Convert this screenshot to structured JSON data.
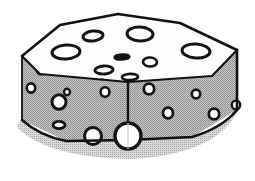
{
  "artwork": {
    "title": "Swiss Cheese Block",
    "subject": "block-of-swiss-cheese",
    "style": "black-and-white-clipart-line-art",
    "projection": "axonometric",
    "caption": "",
    "canvas": {
      "width": 255,
      "height": 181,
      "background": "#ffffff"
    }
  },
  "palette": {
    "outline": "#111111",
    "top_face_fill": "#fdfdfd",
    "left_face_fill": "#b2b2b2",
    "right_face_fill": "#b2b2b2",
    "hole_fill": "#ffffff",
    "hole_stroke": "#141414",
    "shadow_fill": "#bdbdbd",
    "paper_white": "#ffffff"
  },
  "geometry": {
    "top_face": {
      "name": "top-face",
      "points": "22,56 60,25 118,14 180,23 237,50 212,76 128,82 40,74"
    },
    "left_face": {
      "name": "left-face",
      "points": "22,56 40,74 128,82 128,140 66,141 22,120"
    },
    "right_face": {
      "name": "right-face",
      "points": "128,82 212,76 237,50 237,110 192,137 128,140"
    },
    "shadow": {
      "name": "drop-shadow",
      "points": "22,120 18,128 34,140 64,152 128,158 196,148 236,124 237,110 192,137 128,140 66,141"
    },
    "edges": [
      {
        "name": "edge-top-back-left",
        "d": "M22,56 L60,25 L118,14"
      },
      {
        "name": "edge-top-back-right",
        "d": "M118,14 L180,23 L237,50"
      },
      {
        "name": "edge-top-front-left",
        "d": "M22,56 L40,74 L128,82"
      },
      {
        "name": "edge-top-front-right",
        "d": "M128,82 L212,76 L237,50"
      },
      {
        "name": "edge-vertical-left",
        "d": "M22,56 L22,120"
      },
      {
        "name": "edge-vertical-front",
        "d": "M128,82 L128,140"
      },
      {
        "name": "edge-vertical-right",
        "d": "M237,50 L237,110"
      },
      {
        "name": "edge-bottom-left",
        "d": "M22,120 Q40,136 66,141 L128,140"
      },
      {
        "name": "edge-bottom-right",
        "d": "M128,140 L192,137 Q222,128 237,110"
      }
    ]
  },
  "holes": {
    "top_face": [
      {
        "name": "hole-top-1",
        "cx": 93,
        "cy": 36,
        "rx": 10,
        "ry": 5,
        "rot": -6,
        "stroke": 3.0
      },
      {
        "name": "hole-top-2",
        "cx": 140,
        "cy": 34,
        "rx": 13,
        "ry": 7,
        "rot": 3,
        "stroke": 3.0
      },
      {
        "name": "hole-top-3",
        "cx": 66,
        "cy": 52,
        "rx": 14,
        "ry": 7,
        "rot": -4,
        "stroke": 3.0
      },
      {
        "name": "hole-top-4",
        "cx": 196,
        "cy": 51,
        "rx": 14,
        "ry": 7,
        "rot": 4,
        "stroke": 3.0
      },
      {
        "name": "hole-top-5",
        "cx": 122,
        "cy": 57,
        "rx": 7,
        "ry": 2.2,
        "rot": -3,
        "stroke": 3.2
      },
      {
        "name": "hole-top-6",
        "cx": 150,
        "cy": 62,
        "rx": 7,
        "ry": 4.5,
        "rot": 2,
        "stroke": 2.6
      },
      {
        "name": "hole-top-7",
        "cx": 104,
        "cy": 70,
        "rx": 9,
        "ry": 4,
        "rot": -3,
        "stroke": 2.8
      },
      {
        "name": "hole-top-8",
        "cx": 130,
        "cy": 77,
        "rx": 8,
        "ry": 3.2,
        "rot": -2,
        "stroke": 2.8
      },
      {
        "name": "hole-top-9",
        "cx": 102,
        "cy": 80,
        "rx": 1.6,
        "ry": 1.1,
        "rot": 0,
        "stroke": 1.2
      }
    ],
    "left_face": [
      {
        "name": "hole-left-1",
        "cx": 41,
        "cy": 70,
        "rx": 4.2,
        "ry": 4.2,
        "rot": 0,
        "stroke": 2.6
      },
      {
        "name": "hole-left-2",
        "cx": 31,
        "cy": 88,
        "rx": 4.2,
        "ry": 4.6,
        "rot": 0,
        "stroke": 2.6
      },
      {
        "name": "hole-left-3",
        "cx": 67,
        "cy": 92,
        "rx": 3.0,
        "ry": 3.2,
        "rot": 0,
        "stroke": 2.4
      },
      {
        "name": "hole-left-4",
        "cx": 59,
        "cy": 102,
        "rx": 7.0,
        "ry": 7.2,
        "rot": 0,
        "stroke": 3.0
      },
      {
        "name": "hole-left-5",
        "cx": 105,
        "cy": 92,
        "rx": 4.5,
        "ry": 4.8,
        "rot": 0,
        "stroke": 2.6
      },
      {
        "name": "hole-left-6",
        "cx": 59,
        "cy": 125,
        "rx": 6.0,
        "ry": 3.6,
        "rot": 0,
        "stroke": 2.8
      },
      {
        "name": "hole-left-7",
        "cx": 93,
        "cy": 136,
        "rx": 8.5,
        "ry": 8.5,
        "rot": 0,
        "stroke": 3.0
      }
    ],
    "right_face": [
      {
        "name": "hole-right-1",
        "cx": 149,
        "cy": 89,
        "rx": 5.2,
        "ry": 5.4,
        "rot": 0,
        "stroke": 2.8
      },
      {
        "name": "hole-right-2",
        "cx": 196,
        "cy": 94,
        "rx": 4.2,
        "ry": 4.4,
        "rot": 0,
        "stroke": 2.6
      },
      {
        "name": "hole-right-3",
        "cx": 168,
        "cy": 113,
        "rx": 5.0,
        "ry": 5.4,
        "rot": 0,
        "stroke": 2.8
      },
      {
        "name": "hole-right-4",
        "cx": 214,
        "cy": 114,
        "rx": 5.2,
        "ry": 5.4,
        "rot": 0,
        "stroke": 2.8
      },
      {
        "name": "hole-right-5",
        "cx": 236,
        "cy": 105,
        "rx": 4.2,
        "ry": 4.4,
        "rot": 0,
        "stroke": 2.4
      }
    ],
    "front_edge": [
      {
        "name": "hole-front-corner-large",
        "cx": 128,
        "cy": 136,
        "rx": 13,
        "ry": 13,
        "rot": 0,
        "stroke": 3.4
      }
    ]
  }
}
